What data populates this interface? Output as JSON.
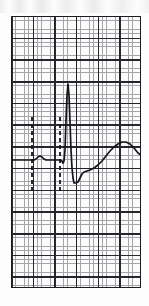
{
  "figure": {
    "kind": "ecg-strip",
    "caption": "",
    "paper": {
      "x": 11,
      "y": 16,
      "width": 130,
      "height": 272,
      "minor_cell_px": 4.33,
      "major_cell_px": 21.66,
      "minor_color": "#8e8e93",
      "major_color": "#1b1b1f",
      "background_color": "#fbfbfc",
      "border_color": "#1b1b1f"
    },
    "trace": {
      "color": "#16161a",
      "width_px": 1.7,
      "baseline_y": 160
    },
    "calipers": {
      "color": "#16161a",
      "width_px": 1.8,
      "dash": "4 3",
      "marks": [
        {
          "name": "caliper-left",
          "x": 32,
          "y_top": 117,
          "y_bottom": 193
        },
        {
          "name": "caliper-right",
          "x": 60,
          "y_top": 117,
          "y_bottom": 193
        }
      ]
    }
  },
  "chart_data": {
    "type": "line",
    "title": "",
    "subtitle": "",
    "xlabel": "",
    "ylabel": "",
    "grid": true,
    "legend": null,
    "xlim": [
      11,
      141
    ],
    "ylim": [
      288,
      16
    ],
    "series": [
      {
        "name": "ecg-lead-trace",
        "color": "#16161a",
        "points": [
          [
            12,
            160
          ],
          [
            18,
            160
          ],
          [
            24,
            160
          ],
          [
            30,
            160
          ],
          [
            34,
            160
          ],
          [
            36,
            159
          ],
          [
            38,
            157
          ],
          [
            40,
            156
          ],
          [
            42,
            157
          ],
          [
            44,
            159
          ],
          [
            46,
            160
          ],
          [
            50,
            160
          ],
          [
            54,
            160
          ],
          [
            58,
            160
          ],
          [
            60,
            160
          ],
          [
            62,
            161
          ],
          [
            63,
            163
          ],
          [
            64,
            161
          ],
          [
            65,
            150
          ],
          [
            66,
            120
          ],
          [
            67,
            95
          ],
          [
            68,
            84
          ],
          [
            69,
            95
          ],
          [
            70,
            122
          ],
          [
            71,
            150
          ],
          [
            72,
            168
          ],
          [
            73,
            178
          ],
          [
            74,
            183
          ],
          [
            76,
            183
          ],
          [
            78,
            182
          ],
          [
            80,
            178
          ],
          [
            82,
            174
          ],
          [
            84,
            172
          ],
          [
            87,
            171
          ],
          [
            90,
            170
          ],
          [
            94,
            168
          ],
          [
            98,
            165
          ],
          [
            102,
            161
          ],
          [
            106,
            156
          ],
          [
            110,
            151
          ],
          [
            114,
            147
          ],
          [
            118,
            144
          ],
          [
            122,
            142
          ],
          [
            126,
            142
          ],
          [
            130,
            144
          ],
          [
            134,
            148
          ],
          [
            138,
            153
          ],
          [
            141,
            155
          ]
        ],
        "features": [
          {
            "label": "P wave",
            "x": 39,
            "y": 156
          },
          {
            "label": "Q",
            "x": 63,
            "y": 163
          },
          {
            "label": "R peak",
            "x": 68,
            "y": 84
          },
          {
            "label": "S trough",
            "x": 75,
            "y": 183
          },
          {
            "label": "T peak",
            "x": 124,
            "y": 142
          }
        ]
      }
    ]
  }
}
